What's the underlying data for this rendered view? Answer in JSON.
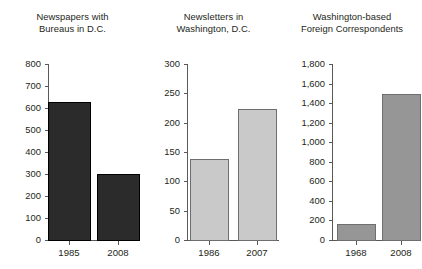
{
  "figure": {
    "background_color": "#ffffff",
    "text_color": "#231f20",
    "axis_color": "#58595b"
  },
  "chart_data": [
    {
      "type": "bar",
      "title": "Newspapers with\nBureaus in D.C.",
      "categories": [
        "1985",
        "2008"
      ],
      "values": [
        625,
        300
      ],
      "xlabel": "",
      "ylabel": "",
      "ylim": [
        0,
        800
      ],
      "yticks": [
        0,
        100,
        200,
        300,
        400,
        500,
        600,
        700,
        800
      ],
      "ytick_labels": [
        "0",
        "100",
        "200",
        "300",
        "400",
        "500",
        "600",
        "700",
        "800"
      ],
      "grid": false,
      "legend": "none",
      "bar_color": "#2b2b2b",
      "bar_edge_color": "#000000"
    },
    {
      "type": "bar",
      "title": "Newsletters in\nWashington, D.C.",
      "categories": [
        "1986",
        "2007"
      ],
      "values": [
        137,
        222
      ],
      "xlabel": "",
      "ylabel": "",
      "ylim": [
        0,
        300
      ],
      "yticks": [
        0,
        50,
        100,
        150,
        200,
        250,
        300
      ],
      "ytick_labels": [
        "0",
        "50",
        "100",
        "150",
        "200",
        "250",
        "300"
      ],
      "grid": false,
      "legend": "none",
      "bar_color": "#c9c9c9",
      "bar_edge_color": "#6d6e70"
    },
    {
      "type": "bar",
      "title": "Washington-based\nForeign Correspondents",
      "categories": [
        "1968",
        "2008"
      ],
      "values": [
        160,
        1490
      ],
      "xlabel": "",
      "ylabel": "",
      "ylim": [
        0,
        1800
      ],
      "yticks": [
        0,
        200,
        400,
        600,
        800,
        1000,
        1200,
        1400,
        1600,
        1800
      ],
      "ytick_labels": [
        "0",
        "200",
        "400",
        "600",
        "800",
        "1,000",
        "1,200",
        "1,400",
        "1,600",
        "1,800"
      ],
      "grid": false,
      "legend": "none",
      "bar_color": "#969696",
      "bar_edge_color": "#6d6e70"
    }
  ]
}
